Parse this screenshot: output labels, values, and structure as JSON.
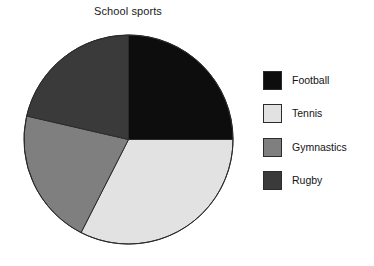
{
  "chart_data": {
    "type": "pie",
    "title": "School sports",
    "xlabel": "",
    "ylabel": "",
    "legend_position": "right",
    "grid": false,
    "start_angle_deg": 0,
    "direction": "clockwise",
    "categories": [
      "Football",
      "Tennis",
      "Gymnastics",
      "Rugby"
    ],
    "values": [
      25,
      32.5,
      21,
      21.5
    ],
    "units": "percent",
    "slices": [
      {
        "label": "Football",
        "value": 25,
        "angle_deg": 90,
        "start_deg": 0,
        "end_deg": 90,
        "color": "#0d0d0d"
      },
      {
        "label": "Tennis",
        "value": 32.5,
        "angle_deg": 117,
        "start_deg": 90,
        "end_deg": 207,
        "color": "#e2e2e2"
      },
      {
        "label": "Gymnastics",
        "value": 21,
        "angle_deg": 76,
        "start_deg": 207,
        "end_deg": 283,
        "color": "#7f7f7f"
      },
      {
        "label": "Rugby",
        "value": 21.5,
        "angle_deg": 77,
        "start_deg": 283,
        "end_deg": 360,
        "color": "#3a3a3a"
      }
    ],
    "colors": [
      "#0d0d0d",
      "#e2e2e2",
      "#7f7f7f",
      "#3a3a3a"
    ],
    "outline_color": "#2b2b2b",
    "background": "#ffffff"
  },
  "legend": {
    "items": [
      {
        "label": "Football",
        "color": "#0d0d0d"
      },
      {
        "label": "Tennis",
        "color": "#e2e2e2"
      },
      {
        "label": "Gymnastics",
        "color": "#7f7f7f"
      },
      {
        "label": "Rugby",
        "color": "#3a3a3a"
      }
    ]
  }
}
